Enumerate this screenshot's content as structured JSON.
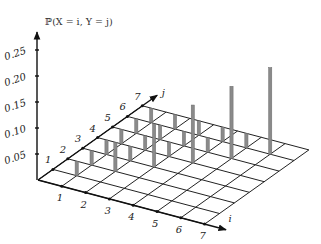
{
  "chart_data": {
    "type": "bar3d",
    "title": "ℙ(X = i, Y = j)",
    "zlabel": "ℙ(X = i, Y = j)",
    "xlabel": "i",
    "ylabel": "j",
    "x_ticks": [
      1,
      2,
      3,
      4,
      5,
      6,
      7
    ],
    "y_ticks": [
      1,
      2,
      3,
      4,
      5,
      6,
      7
    ],
    "z_ticks": [
      "0.05",
      "0.10",
      "0.15",
      "0.20",
      "0.25"
    ],
    "z_tick_values": [
      0.05,
      0.1,
      0.15,
      0.2,
      0.25
    ],
    "zlim": [
      0,
      0.28
    ],
    "grid": true,
    "bar_color": "#8a8a8a",
    "bars": [
      {
        "i": 1,
        "j": 1,
        "p": 0.0278
      },
      {
        "i": 1,
        "j": 2,
        "p": 0.0278
      },
      {
        "i": 1,
        "j": 3,
        "p": 0.0278
      },
      {
        "i": 1,
        "j": 4,
        "p": 0.0278
      },
      {
        "i": 1,
        "j": 5,
        "p": 0.0278
      },
      {
        "i": 1,
        "j": 6,
        "p": 0.0278
      },
      {
        "i": 2,
        "j": 2,
        "p": 0.0556
      },
      {
        "i": 2,
        "j": 3,
        "p": 0.0278
      },
      {
        "i": 2,
        "j": 4,
        "p": 0.0278
      },
      {
        "i": 2,
        "j": 5,
        "p": 0.0278
      },
      {
        "i": 2,
        "j": 6,
        "p": 0.0278
      },
      {
        "i": 3,
        "j": 3,
        "p": 0.0833
      },
      {
        "i": 3,
        "j": 4,
        "p": 0.0278
      },
      {
        "i": 3,
        "j": 5,
        "p": 0.0278
      },
      {
        "i": 3,
        "j": 6,
        "p": 0.0278
      },
      {
        "i": 4,
        "j": 4,
        "p": 0.1111
      },
      {
        "i": 4,
        "j": 5,
        "p": 0.0278
      },
      {
        "i": 4,
        "j": 6,
        "p": 0.0278
      },
      {
        "i": 5,
        "j": 5,
        "p": 0.1389
      },
      {
        "i": 5,
        "j": 6,
        "p": 0.0278
      },
      {
        "i": 6,
        "j": 6,
        "p": 0.1667
      }
    ]
  }
}
